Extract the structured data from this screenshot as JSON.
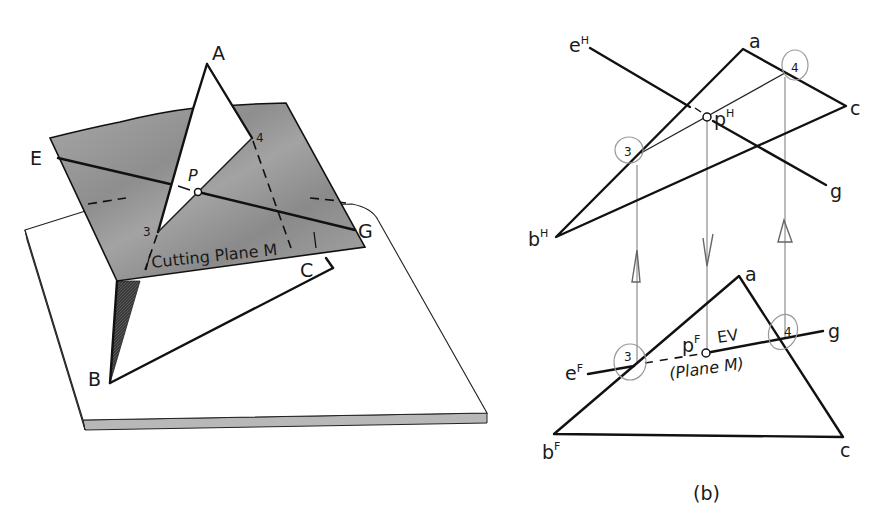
{
  "figure": {
    "caption": "(b)",
    "colors": {
      "line": "#111111",
      "plane_fill": "#9a9a9a",
      "plane_dark": "#7d7d7d",
      "slab_edge": "#b5b5b5",
      "shadow": "#3a3a3a",
      "projection": "#777777",
      "annotation_circle": "#999999"
    }
  },
  "pictorial": {
    "vertices": {
      "A": "A",
      "B": "B",
      "C": "C"
    },
    "line_endpoints": {
      "E": "E",
      "G": "G"
    },
    "piercing_point": "P",
    "point_3": "3",
    "point_4": "4",
    "plane_label": "Cutting Plane M"
  },
  "top_view": {
    "view_suffix": "H",
    "vertex_a": "a",
    "vertex_b": "b",
    "vertex_c": "c",
    "line_e": "e",
    "line_g": "g",
    "point_p": "p",
    "point_3": "3",
    "point_4": "4"
  },
  "front_view": {
    "view_suffix": "F",
    "vertex_a": "a",
    "vertex_b": "b",
    "vertex_c": "c",
    "line_e": "e",
    "line_g": "g",
    "point_p": "p",
    "point_3": "3",
    "point_4": "4",
    "edge_view_label": "EV",
    "plane_label": "(Plane M)"
  }
}
